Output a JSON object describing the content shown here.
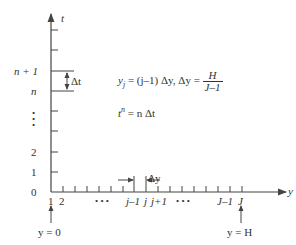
{
  "diagram": {
    "type": "finite-difference grid",
    "axes": {
      "vertical_label": "t",
      "horizontal_label": "y"
    },
    "vertical_tick_labels": {
      "n_plus_1": "n + 1",
      "n": "n",
      "two": "2",
      "one": "1",
      "zero": "0"
    },
    "vertical_delta": "Δt",
    "horizontal_tick_labels": {
      "one": "1",
      "two": "2",
      "dots_left": "• • •",
      "j_minus_1": "j–1",
      "j": "j",
      "j_plus_1": "j+1",
      "dots_right": "• • •",
      "J_minus_1": "J–1",
      "J": "J"
    },
    "horizontal_delta": "Δy",
    "boundary_left": "y = 0",
    "boundary_right": "y = H",
    "equations": {
      "yj_lhs": "y",
      "yj_sub": "j",
      "yj_rhs": " = (j–1) Δy, Δy = ",
      "frac_num": "H",
      "frac_den": "J–1",
      "tn_lhs": "t",
      "tn_sup": "n",
      "tn_rhs": " = n Δt"
    },
    "colors": {
      "line": "#444444",
      "text": "#333333"
    }
  }
}
